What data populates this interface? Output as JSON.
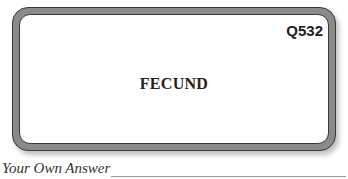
{
  "card": {
    "question_id": "Q532",
    "word": "FECUND"
  },
  "answer": {
    "label": "Your Own Answer",
    "value": ""
  },
  "colors": {
    "border_band": "#8a8a8a",
    "border_outline": "#3a3a3a",
    "text": "#222222"
  }
}
